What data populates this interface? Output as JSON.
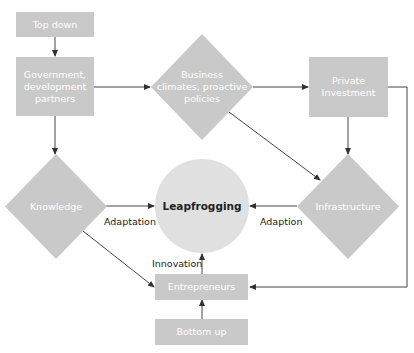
{
  "diagram": {
    "colors": {
      "node_fill": "#c9c9c9",
      "center_fill": "#e0e0e0",
      "node_text": "#ffffff",
      "center_text": "#222222",
      "edge_color": "#444444"
    },
    "nodes": {
      "top_down": {
        "label": "Top down",
        "shape": "rectangle"
      },
      "government": {
        "label": "Government, development partners",
        "lines": [
          "Government,",
          "development",
          "partners"
        ],
        "shape": "rectangle"
      },
      "business": {
        "label": "Business climates, proactive policies",
        "lines": [
          "Business",
          "climates, proactive",
          "policies"
        ],
        "shape": "diamond"
      },
      "private_investment": {
        "label": "Private Investment",
        "lines": [
          "Private",
          "Investment"
        ],
        "shape": "rectangle"
      },
      "knowledge": {
        "label": "Knowledge",
        "shape": "diamond"
      },
      "leapfrogging": {
        "label": "Leapfrogging",
        "shape": "circle"
      },
      "infrastructure": {
        "label": "Infrastructure",
        "shape": "diamond"
      },
      "entrepreneurs": {
        "label": "Entrepreneurs",
        "shape": "rectangle"
      },
      "bottom_up": {
        "label": "Bottom up",
        "shape": "rectangle"
      }
    },
    "edge_labels": {
      "knowledge_to_leapfrogging": "Adaptation",
      "infrastructure_to_leapfrogging": "Adaption",
      "entrepreneurs_to_leapfrogging": "Innovation"
    },
    "edges": [
      {
        "from": "Top down",
        "to": "Government, development partners"
      },
      {
        "from": "Government, development partners",
        "to": "Business climates, proactive policies"
      },
      {
        "from": "Government, development partners",
        "to": "Knowledge"
      },
      {
        "from": "Business climates, proactive policies",
        "to": "Private Investment"
      },
      {
        "from": "Business climates, proactive policies",
        "to": "Infrastructure"
      },
      {
        "from": "Private Investment",
        "to": "Infrastructure"
      },
      {
        "from": "Private Investment",
        "to": "Entrepreneurs"
      },
      {
        "from": "Knowledge",
        "to": "Leapfrogging",
        "label": "Adaptation"
      },
      {
        "from": "Knowledge",
        "to": "Entrepreneurs"
      },
      {
        "from": "Infrastructure",
        "to": "Leapfrogging",
        "label": "Adaption"
      },
      {
        "from": "Entrepreneurs",
        "to": "Leapfrogging",
        "label": "Innovation"
      },
      {
        "from": "Bottom up",
        "to": "Entrepreneurs"
      }
    ]
  }
}
